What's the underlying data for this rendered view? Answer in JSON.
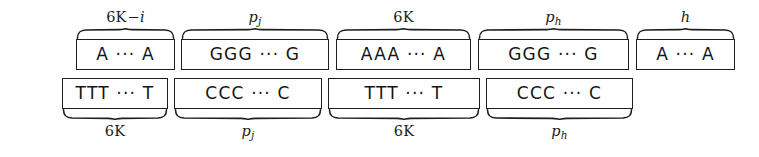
{
  "figure": {
    "stroke_color": "#1e1e1e",
    "background_color": "#ffffff",
    "top_row": {
      "blocks": [
        {
          "text": "A ··· A",
          "label_main": "6K",
          "label_op": "−",
          "label_sub_italic": "i",
          "label_display": "6K−i"
        },
        {
          "text": "GGG ··· G",
          "label_main": "p",
          "label_op": "",
          "label_sub_italic": "j",
          "label_display": "p_j"
        },
        {
          "text": "AAA ··· A",
          "label_main": "6K",
          "label_op": "",
          "label_sub_italic": "",
          "label_display": "6K"
        },
        {
          "text": "GGG ··· G",
          "label_main": "p",
          "label_op": "",
          "label_sub_italic": "h",
          "label_display": "p_h"
        },
        {
          "text": "A ··· A",
          "label_main": "h",
          "label_op": "",
          "label_sub_italic": "",
          "label_display": "h"
        }
      ]
    },
    "bottom_row": {
      "blocks": [
        {
          "text": "TTT ··· T",
          "label_main": "6K",
          "label_op": "",
          "label_sub_italic": "",
          "label_display": "6K"
        },
        {
          "text": "CCC ··· C",
          "label_main": "p",
          "label_op": "",
          "label_sub_italic": "j",
          "label_display": "p_j"
        },
        {
          "text": "TTT ··· T",
          "label_main": "6K",
          "label_op": "",
          "label_sub_italic": "",
          "label_display": "6K"
        },
        {
          "text": "CCC ··· C",
          "label_main": "p",
          "label_op": "",
          "label_sub_italic": "h",
          "label_display": "p_h"
        }
      ]
    }
  }
}
